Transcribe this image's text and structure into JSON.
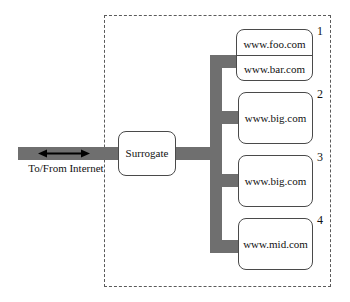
{
  "diagram": {
    "enclosure": {
      "style": "dashed-boundary"
    },
    "link": {
      "label": "To/From Internet",
      "arrow": "double-headed-arrow",
      "direction": "bidirectional"
    },
    "surrogate": {
      "label": "Surrogate"
    },
    "servers": [
      {
        "numeral": "1",
        "hosts": [
          "www.foo.com",
          "www.bar.com"
        ]
      },
      {
        "numeral": "2",
        "hosts": [
          "www.big.com"
        ]
      },
      {
        "numeral": "3",
        "hosts": [
          "www.big.com"
        ]
      },
      {
        "numeral": "4",
        "hosts": [
          "www.mid.com"
        ]
      }
    ]
  },
  "colors": {
    "connector": "#6f6f6f",
    "box_border": "#4a4a4a",
    "enclosure_border": "#5a5a5a",
    "text": "#111111",
    "background": "#ffffff",
    "arrow": "#000000"
  }
}
